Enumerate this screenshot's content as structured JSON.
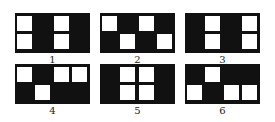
{
  "figure": {
    "panel_color": "#111111",
    "square_color": "#ffffff",
    "panels": [
      {
        "label": "1",
        "x": 15,
        "y": 13,
        "squares": [
          [
            0,
            0
          ],
          [
            2,
            0
          ],
          [
            0,
            1
          ],
          [
            2,
            1
          ]
        ]
      },
      {
        "label": "2",
        "x": 100,
        "y": 13,
        "squares": [
          [
            0,
            0
          ],
          [
            2,
            0
          ],
          [
            1,
            1
          ],
          [
            3,
            1
          ]
        ]
      },
      {
        "label": "3",
        "x": 185,
        "y": 13,
        "squares": [
          [
            1,
            0
          ],
          [
            3,
            0
          ],
          [
            1,
            1
          ],
          [
            3,
            1
          ]
        ]
      },
      {
        "label": "4",
        "x": 15,
        "y": 64,
        "squares": [
          [
            0,
            0
          ],
          [
            2,
            0
          ],
          [
            3,
            0
          ],
          [
            1,
            1
          ]
        ]
      },
      {
        "label": "5",
        "x": 100,
        "y": 64,
        "squares": [
          [
            1,
            0
          ],
          [
            2,
            0
          ],
          [
            1,
            1
          ],
          [
            2,
            1
          ]
        ]
      },
      {
        "label": "6",
        "x": 185,
        "y": 64,
        "squares": [
          [
            1,
            0
          ],
          [
            0,
            1
          ],
          [
            2,
            1
          ],
          [
            3,
            1
          ]
        ]
      }
    ]
  }
}
